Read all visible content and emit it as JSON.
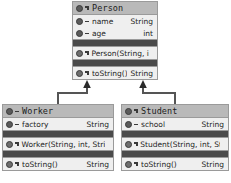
{
  "diagram": {
    "type": "uml-class-diagram",
    "colors": {
      "class_body": "#efefef",
      "class_header": "#b9b9b9",
      "border": "#9a9a9a",
      "separator_band": "#4a4a4a",
      "text": "#1d1d1d",
      "edge": "#555555",
      "background": "#ffffff"
    },
    "classes": [
      {
        "id": "person",
        "name": "Person",
        "header_icon": "class-icon",
        "header_marker": "inherit-marker-icon",
        "x": 72,
        "y": 1,
        "width": 86,
        "sections": [
          {
            "kind": "fields",
            "rows": [
              {
                "icon": "field-icon",
                "marker": "private-marker-icon",
                "name": "name",
                "type": "String"
              },
              {
                "icon": "field-icon",
                "marker": "private-marker-icon",
                "name": "age",
                "type": "int"
              }
            ]
          },
          {
            "kind": "separator",
            "rows": []
          },
          {
            "kind": "constructors",
            "rows": [
              {
                "icon": "method-icon",
                "marker": "inherit-marker-icon",
                "name": "Person(String, int)",
                "type": ""
              }
            ]
          },
          {
            "kind": "separator",
            "rows": []
          },
          {
            "kind": "methods",
            "rows": [
              {
                "icon": "method-icon",
                "marker": "inherit-marker-icon",
                "name": "toString()",
                "type": "String"
              }
            ]
          }
        ]
      },
      {
        "id": "worker",
        "name": "Worker",
        "header_icon": "class-icon",
        "header_marker": "private-marker-icon",
        "x": 2,
        "y": 104,
        "width": 112,
        "sections": [
          {
            "kind": "fields",
            "rows": [
              {
                "icon": "field-icon",
                "marker": "private-marker-icon",
                "name": "factory",
                "type": "String"
              }
            ]
          },
          {
            "kind": "separator",
            "rows": []
          },
          {
            "kind": "constructors",
            "rows": [
              {
                "icon": "method-icon",
                "marker": "inherit-marker-icon",
                "name": "Worker(String, int, String)",
                "type": ""
              }
            ]
          },
          {
            "kind": "separator",
            "rows": []
          },
          {
            "kind": "methods",
            "rows": [
              {
                "icon": "method-icon",
                "marker": "inherit-marker-icon",
                "name": "toString()",
                "type": "String"
              }
            ]
          }
        ]
      },
      {
        "id": "student",
        "name": "Student",
        "header_icon": "class-icon",
        "header_marker": "inherit-marker-icon",
        "x": 121,
        "y": 104,
        "width": 108,
        "sections": [
          {
            "kind": "fields",
            "rows": [
              {
                "icon": "field-icon",
                "marker": "private-marker-icon",
                "name": "school",
                "type": "String"
              }
            ]
          },
          {
            "kind": "separator",
            "rows": []
          },
          {
            "kind": "constructors",
            "rows": [
              {
                "icon": "method-icon",
                "marker": "inherit-marker-icon",
                "name": "Student(String, int, String)",
                "type": ""
              }
            ]
          },
          {
            "kind": "separator",
            "rows": []
          },
          {
            "kind": "methods",
            "rows": [
              {
                "icon": "method-icon",
                "marker": "inherit-marker-icon",
                "name": "toString()",
                "type": "String"
              }
            ]
          }
        ]
      }
    ],
    "edges": [
      {
        "id": "worker-extends-person",
        "kind": "generalization",
        "from": "worker",
        "to": "person",
        "arrow": "solid-arrowhead-up",
        "points": "58,104 58,93 87,93 87,82"
      },
      {
        "id": "student-extends-person",
        "kind": "generalization",
        "from": "student",
        "to": "person",
        "arrow": "solid-arrowhead-up",
        "points": "175,104 175,93 143,93 143,82"
      }
    ]
  }
}
